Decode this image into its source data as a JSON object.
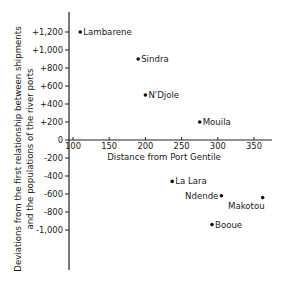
{
  "chart_data": {
    "type": "scatter",
    "title": "",
    "xlabel": "Distance from Port Gentile",
    "ylabel_line1": "Deviations from the first relationship between shipments",
    "ylabel_line2": "and the populations of the river ports",
    "xlim": [
      90,
      370
    ],
    "ylim": [
      -1300,
      1400
    ],
    "x_ticks": [
      100,
      150,
      200,
      250,
      300,
      350
    ],
    "x_tick_labels": [
      "100",
      "150",
      "200",
      "250",
      "300",
      "350"
    ],
    "y_ticks": [
      1200,
      1000,
      800,
      600,
      400,
      200,
      0,
      -200,
      -400,
      -600,
      -800,
      -1000
    ],
    "y_tick_labels": [
      "+1,200",
      "+1,000",
      "+800",
      "+600",
      "+400",
      "+200",
      "0",
      "-200",
      "-400",
      "-600",
      "-800",
      "-1,000"
    ],
    "grid": false,
    "legend": null,
    "points": [
      {
        "label": "Lambarene",
        "x": 110,
        "y": 1200,
        "label_pos": "right"
      },
      {
        "label": "Sindra",
        "x": 190,
        "y": 900,
        "label_pos": "right"
      },
      {
        "label": "N'Djole",
        "x": 200,
        "y": 500,
        "label_pos": "right"
      },
      {
        "label": "Mouila",
        "x": 275,
        "y": 200,
        "label_pos": "right"
      },
      {
        "label": "La Lara",
        "x": 237,
        "y": -460,
        "label_pos": "right"
      },
      {
        "label": "Ndende",
        "x": 305,
        "y": -620,
        "label_pos": "left"
      },
      {
        "label": "Makotou",
        "x": 362,
        "y": -640,
        "label_pos": "below-left"
      },
      {
        "label": "Booue",
        "x": 292,
        "y": -940,
        "label_pos": "right"
      }
    ]
  }
}
